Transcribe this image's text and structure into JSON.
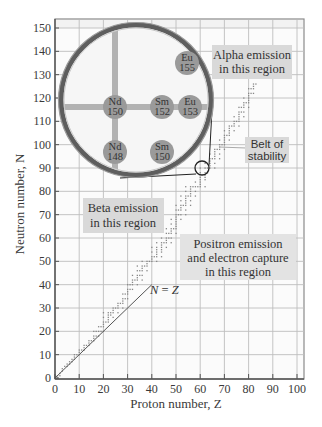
{
  "chart_data": {
    "type": "scatter",
    "title": "",
    "xlabel": "Proton number, Z",
    "ylabel": "Neutron number, N",
    "xlim": [
      0,
      100
    ],
    "ylim": [
      0,
      150
    ],
    "x_ticks": [
      0,
      10,
      20,
      30,
      40,
      50,
      60,
      70,
      80,
      90,
      100
    ],
    "y_ticks": [
      0,
      10,
      20,
      30,
      40,
      50,
      60,
      70,
      80,
      90,
      100,
      110,
      120,
      130,
      140,
      150
    ],
    "grid": true,
    "reference_line": {
      "label": "N = Z",
      "label_parts": [
        "N",
        " = ",
        "Z"
      ],
      "from": [
        0,
        0
      ],
      "to": [
        40,
        40
      ]
    },
    "series": [
      {
        "name": "Belt of stability (stable nuclei)",
        "points": [
          [
            1,
            0
          ],
          [
            1,
            1
          ],
          [
            2,
            1
          ],
          [
            2,
            2
          ],
          [
            3,
            3
          ],
          [
            3,
            4
          ],
          [
            4,
            5
          ],
          [
            5,
            5
          ],
          [
            5,
            6
          ],
          [
            6,
            6
          ],
          [
            6,
            7
          ],
          [
            7,
            7
          ],
          [
            7,
            8
          ],
          [
            8,
            8
          ],
          [
            8,
            9
          ],
          [
            8,
            10
          ],
          [
            9,
            10
          ],
          [
            10,
            10
          ],
          [
            10,
            11
          ],
          [
            10,
            12
          ],
          [
            11,
            12
          ],
          [
            12,
            12
          ],
          [
            12,
            13
          ],
          [
            12,
            14
          ],
          [
            13,
            14
          ],
          [
            14,
            14
          ],
          [
            14,
            15
          ],
          [
            14,
            16
          ],
          [
            15,
            16
          ],
          [
            16,
            16
          ],
          [
            16,
            17
          ],
          [
            16,
            18
          ],
          [
            16,
            20
          ],
          [
            17,
            18
          ],
          [
            17,
            20
          ],
          [
            18,
            18
          ],
          [
            18,
            20
          ],
          [
            18,
            22
          ],
          [
            19,
            20
          ],
          [
            19,
            22
          ],
          [
            20,
            20
          ],
          [
            20,
            22
          ],
          [
            20,
            23
          ],
          [
            20,
            24
          ],
          [
            20,
            26
          ],
          [
            20,
            28
          ],
          [
            21,
            24
          ],
          [
            22,
            24
          ],
          [
            22,
            25
          ],
          [
            22,
            26
          ],
          [
            22,
            27
          ],
          [
            22,
            28
          ],
          [
            23,
            27
          ],
          [
            23,
            28
          ],
          [
            24,
            26
          ],
          [
            24,
            28
          ],
          [
            24,
            29
          ],
          [
            24,
            30
          ],
          [
            25,
            30
          ],
          [
            26,
            28
          ],
          [
            26,
            30
          ],
          [
            26,
            31
          ],
          [
            26,
            32
          ],
          [
            27,
            32
          ],
          [
            28,
            30
          ],
          [
            28,
            32
          ],
          [
            28,
            33
          ],
          [
            28,
            34
          ],
          [
            28,
            36
          ],
          [
            29,
            34
          ],
          [
            29,
            36
          ],
          [
            30,
            34
          ],
          [
            30,
            36
          ],
          [
            30,
            37
          ],
          [
            30,
            38
          ],
          [
            30,
            40
          ],
          [
            31,
            38
          ],
          [
            31,
            40
          ],
          [
            32,
            38
          ],
          [
            32,
            40
          ],
          [
            32,
            41
          ],
          [
            32,
            42
          ],
          [
            32,
            44
          ],
          [
            33,
            42
          ],
          [
            34,
            40
          ],
          [
            34,
            42
          ],
          [
            34,
            43
          ],
          [
            34,
            44
          ],
          [
            34,
            46
          ],
          [
            34,
            48
          ],
          [
            35,
            44
          ],
          [
            35,
            46
          ],
          [
            36,
            42
          ],
          [
            36,
            44
          ],
          [
            36,
            46
          ],
          [
            36,
            47
          ],
          [
            36,
            48
          ],
          [
            36,
            50
          ],
          [
            37,
            48
          ],
          [
            38,
            46
          ],
          [
            38,
            48
          ],
          [
            38,
            49
          ],
          [
            38,
            50
          ],
          [
            39,
            50
          ],
          [
            40,
            50
          ],
          [
            40,
            51
          ],
          [
            40,
            52
          ],
          [
            40,
            54
          ],
          [
            40,
            56
          ],
          [
            41,
            52
          ],
          [
            42,
            50
          ],
          [
            42,
            52
          ],
          [
            42,
            53
          ],
          [
            42,
            54
          ],
          [
            42,
            55
          ],
          [
            42,
            56
          ],
          [
            42,
            58
          ],
          [
            44,
            52
          ],
          [
            44,
            54
          ],
          [
            44,
            55
          ],
          [
            44,
            56
          ],
          [
            44,
            57
          ],
          [
            44,
            58
          ],
          [
            44,
            60
          ],
          [
            45,
            58
          ],
          [
            46,
            56
          ],
          [
            46,
            58
          ],
          [
            46,
            59
          ],
          [
            46,
            60
          ],
          [
            46,
            62
          ],
          [
            46,
            64
          ],
          [
            47,
            60
          ],
          [
            47,
            62
          ],
          [
            48,
            58
          ],
          [
            48,
            60
          ],
          [
            48,
            62
          ],
          [
            48,
            63
          ],
          [
            48,
            64
          ],
          [
            48,
            66
          ],
          [
            48,
            68
          ],
          [
            49,
            64
          ],
          [
            50,
            62
          ],
          [
            50,
            64
          ],
          [
            50,
            65
          ],
          [
            50,
            66
          ],
          [
            50,
            67
          ],
          [
            50,
            68
          ],
          [
            50,
            69
          ],
          [
            50,
            70
          ],
          [
            50,
            72
          ],
          [
            50,
            74
          ],
          [
            51,
            70
          ],
          [
            51,
            72
          ],
          [
            52,
            68
          ],
          [
            52,
            70
          ],
          [
            52,
            72
          ],
          [
            52,
            73
          ],
          [
            52,
            74
          ],
          [
            52,
            76
          ],
          [
            52,
            78
          ],
          [
            53,
            74
          ],
          [
            54,
            70
          ],
          [
            54,
            72
          ],
          [
            54,
            74
          ],
          [
            54,
            75
          ],
          [
            54,
            76
          ],
          [
            54,
            77
          ],
          [
            54,
            78
          ],
          [
            54,
            80
          ],
          [
            54,
            82
          ],
          [
            55,
            78
          ],
          [
            56,
            74
          ],
          [
            56,
            76
          ],
          [
            56,
            78
          ],
          [
            56,
            79
          ],
          [
            56,
            80
          ],
          [
            56,
            81
          ],
          [
            56,
            82
          ],
          [
            57,
            82
          ],
          [
            58,
            78
          ],
          [
            58,
            80
          ],
          [
            58,
            82
          ],
          [
            58,
            84
          ],
          [
            59,
            82
          ],
          [
            60,
            82
          ],
          [
            60,
            83
          ],
          [
            60,
            84
          ],
          [
            60,
            85
          ],
          [
            60,
            86
          ],
          [
            60,
            88
          ],
          [
            60,
            90
          ],
          [
            62,
            82
          ],
          [
            62,
            85
          ],
          [
            62,
            86
          ],
          [
            62,
            87
          ],
          [
            62,
            88
          ],
          [
            62,
            90
          ],
          [
            62,
            92
          ],
          [
            63,
            88
          ],
          [
            63,
            90
          ],
          [
            64,
            90
          ],
          [
            64,
            91
          ],
          [
            64,
            92
          ],
          [
            64,
            93
          ],
          [
            64,
            94
          ],
          [
            64,
            96
          ],
          [
            65,
            94
          ],
          [
            66,
            90
          ],
          [
            66,
            92
          ],
          [
            66,
            94
          ],
          [
            66,
            95
          ],
          [
            66,
            96
          ],
          [
            66,
            97
          ],
          [
            66,
            98
          ],
          [
            67,
            98
          ],
          [
            68,
            94
          ],
          [
            68,
            96
          ],
          [
            68,
            98
          ],
          [
            68,
            99
          ],
          [
            68,
            100
          ],
          [
            68,
            102
          ],
          [
            69,
            100
          ],
          [
            70,
            98
          ],
          [
            70,
            100
          ],
          [
            70,
            101
          ],
          [
            70,
            102
          ],
          [
            70,
            103
          ],
          [
            70,
            104
          ],
          [
            70,
            106
          ],
          [
            71,
            104
          ],
          [
            72,
            102
          ],
          [
            72,
            104
          ],
          [
            72,
            105
          ],
          [
            72,
            106
          ],
          [
            72,
            107
          ],
          [
            72,
            108
          ],
          [
            73,
            108
          ],
          [
            74,
            106
          ],
          [
            74,
            108
          ],
          [
            74,
            109
          ],
          [
            74,
            110
          ],
          [
            74,
            112
          ],
          [
            75,
            110
          ],
          [
            76,
            108
          ],
          [
            76,
            110
          ],
          [
            76,
            111
          ],
          [
            76,
            112
          ],
          [
            76,
            113
          ],
          [
            76,
            114
          ],
          [
            76,
            116
          ],
          [
            77,
            114
          ],
          [
            77,
            116
          ],
          [
            78,
            112
          ],
          [
            78,
            114
          ],
          [
            78,
            116
          ],
          [
            78,
            117
          ],
          [
            78,
            118
          ],
          [
            78,
            120
          ],
          [
            79,
            118
          ],
          [
            80,
            116
          ],
          [
            80,
            118
          ],
          [
            80,
            119
          ],
          [
            80,
            120
          ],
          [
            80,
            121
          ],
          [
            80,
            122
          ],
          [
            80,
            124
          ],
          [
            81,
            122
          ],
          [
            81,
            124
          ],
          [
            82,
            122
          ],
          [
            82,
            124
          ],
          [
            82,
            125
          ],
          [
            82,
            126
          ],
          [
            83,
            126
          ]
        ]
      }
    ],
    "regions": [
      {
        "name": "alpha",
        "lines": [
          "Alpha emission",
          "in this region"
        ]
      },
      {
        "name": "beta",
        "lines": [
          "Beta emission",
          "in this region"
        ]
      },
      {
        "name": "positron",
        "lines": [
          "Positron emission",
          "and electron capture",
          "in this region"
        ]
      },
      {
        "name": "belt",
        "lines": [
          "Belt of",
          "stability"
        ]
      }
    ],
    "inset": {
      "description": "Magnified view of the belt of stability near Z=60, N=90",
      "focus": [
        60,
        90
      ],
      "nuclides": [
        {
          "symbol": "Eu",
          "mass": "155"
        },
        {
          "symbol": "Nd",
          "mass": "150"
        },
        {
          "symbol": "Sm",
          "mass": "152"
        },
        {
          "symbol": "Eu",
          "mass": "153"
        },
        {
          "symbol": "Nd",
          "mass": "148"
        },
        {
          "symbol": "Sm",
          "mass": "150"
        }
      ]
    },
    "colors": {
      "grid": "#bdbdbd",
      "plot_bg": "#fbfbfb",
      "label_box": "#d9d9d9",
      "nuclide_fill": "#9a9a9a",
      "inset_bar": "#b2b2b2",
      "ring": "#6f6f6f",
      "dots": "#888888"
    }
  }
}
